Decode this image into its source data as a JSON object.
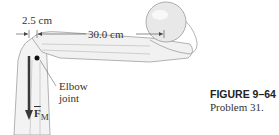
{
  "figure": {
    "dimensions": {
      "short_distance": "2.5 cm",
      "long_distance": "30.0 cm"
    },
    "labels": {
      "joint_line1": "Elbow",
      "joint_line2": "joint",
      "force_symbol": "F",
      "force_subscript": "M"
    },
    "caption": {
      "title": "FIGURE 9–64",
      "subtitle": "Problem 31."
    },
    "colors": {
      "bone": "#f2f2f2",
      "bone_outline": "#9a9a9a",
      "arrow": "#3a3a3a",
      "ball": "#e6e6e6"
    }
  }
}
